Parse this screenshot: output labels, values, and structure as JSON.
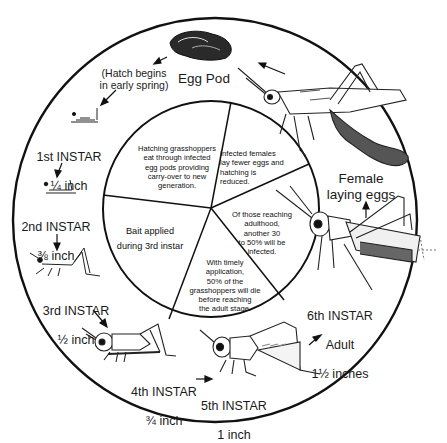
{
  "outer_ring": {
    "egg_pod": {
      "label": "Egg Pod",
      "icon": "egg-pod-icon"
    },
    "hatch_note": {
      "label": "(Hatch begins\nin early spring)"
    },
    "stages": [
      {
        "name": "1st INSTAR",
        "size": "¼ inch",
        "icon": "nymph-1st-instar-icon"
      },
      {
        "name": "2nd INSTAR",
        "size": "⅜ inch",
        "icon": "nymph-2nd-instar-icon"
      },
      {
        "name": "3rd INSTAR",
        "size": "½ inch",
        "icon": "nymph-3rd-instar-icon"
      },
      {
        "name": "4th INSTAR",
        "size": "¾ inch",
        "icon": "nymph-4th-instar-icon"
      },
      {
        "name": "5th INSTAR",
        "size": "1 inch",
        "icon": "nymph-5th-instar-icon"
      },
      {
        "name": "6th INSTAR",
        "sub": "Adult",
        "size": "1½ inches",
        "icon": "adult-grasshopper-icon"
      }
    ],
    "female": {
      "label": "Female\nlaying eggs",
      "icon": "female-laying-eggs-icon"
    }
  },
  "inner_pie": {
    "segments": [
      {
        "id": "carry-over",
        "text": "Hatching grasshoppers\neat through infected\negg pods providing\ncarry-over to new\ngeneration."
      },
      {
        "id": "fewer-eggs",
        "text": "Infected females\nlay fewer eggs and\nhatching is\nreduced."
      },
      {
        "id": "adult-infected",
        "text": "Of those reaching\nadulthood,\nanother 30\nto 50% will be\ninfected."
      },
      {
        "id": "die-before-adult",
        "text": "With timely\napplication,\n50% of the\ngrasshoppers will die\nbefore reaching\nthe adult stage."
      },
      {
        "id": "bait-applied",
        "text": "Bait applied\nduring 3rd instar"
      }
    ]
  },
  "colors": {
    "ink": "#111111",
    "paper": "#ffffff",
    "shade": "#8a8a8a"
  }
}
